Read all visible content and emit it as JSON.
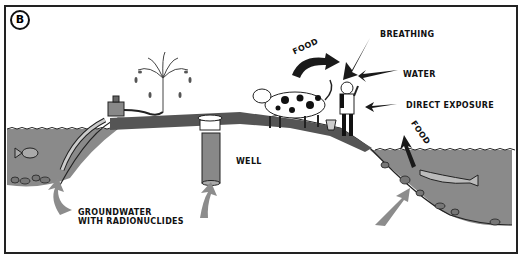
{
  "figure": {
    "panel_label": "B",
    "labels": {
      "breathing": "BREATHING",
      "water": "WATER",
      "direct_exposure": "DIRECT EXPOSURE",
      "food_cow": "FOOD",
      "food_fish": "FOOD",
      "well": "WELL",
      "groundwater": "GROUNDWATER",
      "groundwater_line2": "WITH RADIONUCLIDES"
    },
    "colors": {
      "water": "#8a8a8a",
      "ground": "#555555",
      "arrow_grey": "#8c8c8c",
      "arrow_dark": "#1a1a1a"
    }
  }
}
